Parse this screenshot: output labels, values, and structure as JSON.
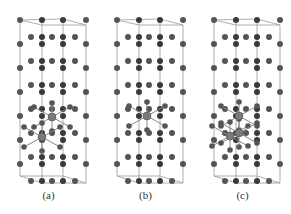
{
  "figure": {
    "panels": [
      {
        "label": "(a)",
        "highlight_atoms": [
          [
            52,
            117
          ],
          [
            42,
            137
          ]
        ]
      },
      {
        "label": "(b)",
        "highlight_atoms": [
          [
            50,
            116
          ]
        ]
      },
      {
        "label": "(c)",
        "highlight_atoms": [
          [
            45,
            116
          ],
          [
            36,
            136
          ],
          [
            45,
            133
          ]
        ]
      }
    ]
  },
  "colors": {
    "atom_dark": "#3a3a3a",
    "atom_medium": "#555555",
    "atom_highlight": "#7a7a7a",
    "bond": "#888888",
    "cell_edge": "#999999",
    "label": "#333333"
  }
}
